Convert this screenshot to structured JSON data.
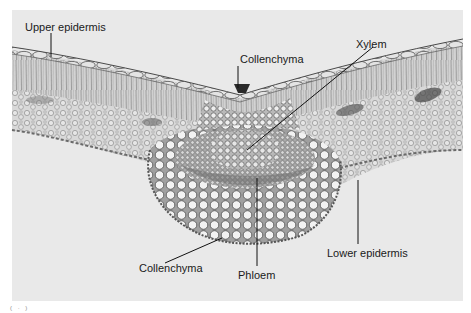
{
  "figure": {
    "background_color": "#e9e9e9",
    "labels": [
      {
        "id": "upper-epidermis",
        "text": "Upper epidermis",
        "x": 25,
        "y": 21
      },
      {
        "id": "collenchyma-top",
        "text": "Collenchyma",
        "x": 240,
        "y": 53
      },
      {
        "id": "xylem",
        "text": "Xylem",
        "x": 356,
        "y": 38
      },
      {
        "id": "collenchyma-bottom",
        "text": "Collenchyma",
        "x": 139,
        "y": 262
      },
      {
        "id": "phloem",
        "text": "Phloem",
        "x": 238,
        "y": 269
      },
      {
        "id": "lower-epidermis",
        "text": "Lower epidermis",
        "x": 327,
        "y": 247
      }
    ],
    "panel_mark": "( · )"
  }
}
